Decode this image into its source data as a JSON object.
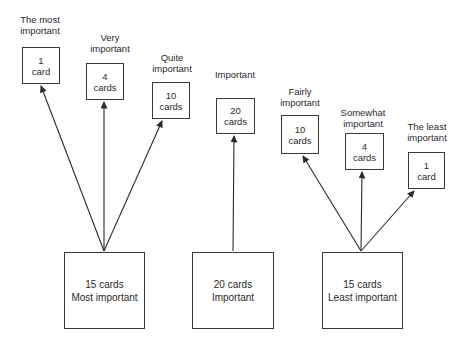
{
  "diagram": {
    "colors": {
      "background": "#ffffff",
      "line": "#2b2b2b",
      "text": "#2b2b2b",
      "box_border": "#3a3a3a"
    },
    "piles": [
      {
        "label": "The most\nimportant",
        "box": "1\ncard"
      },
      {
        "label": "Very\nimportant",
        "box": "4\ncards"
      },
      {
        "label": "Quite\nimportant",
        "box": "10\ncards"
      },
      {
        "label": "Important",
        "box": "20\ncards"
      },
      {
        "label": "Fairly\nimportant",
        "box": "10\ncards"
      },
      {
        "label": "Somewhat\nimportant",
        "box": "4\ncards"
      },
      {
        "label": "The least\nimportant",
        "box": "1\ncard"
      }
    ],
    "stacks": [
      {
        "label": "15 cards\nMost important"
      },
      {
        "label": "20 cards\nImportant"
      },
      {
        "label": "15 cards\nLeast important"
      }
    ]
  }
}
